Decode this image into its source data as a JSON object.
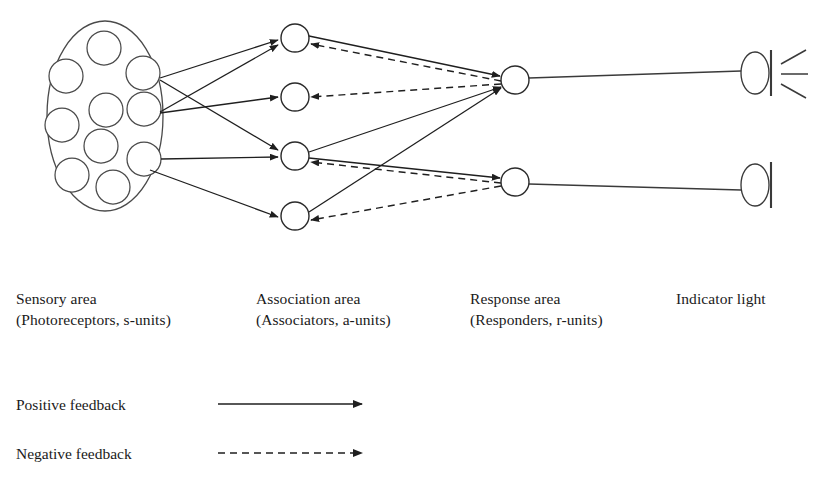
{
  "figure": {
    "background_color": "#ffffff",
    "line_color": "#1f1f1f"
  },
  "columns": [
    {
      "id": "sensory",
      "line1": "Sensory area",
      "line2": "(Photoreceptors, s-units)",
      "x": 16
    },
    {
      "id": "association",
      "line1": "Association area",
      "line2": "(Associators, a-units)",
      "x": 256
    },
    {
      "id": "response",
      "line1": "Response area",
      "line2": "(Responders, r-units)",
      "x": 470
    },
    {
      "id": "indicator",
      "line1": "Indicator light",
      "line2": "",
      "x": 676
    }
  ],
  "legend": {
    "items": [
      {
        "id": "positive",
        "label": "Positive feedback",
        "style": "solid"
      },
      {
        "id": "negative",
        "label": "Negative feedback",
        "style": "dashed"
      }
    ]
  },
  "sensory_area": {
    "ellipse": {
      "cx": 105,
      "cy": 116,
      "rx": 58,
      "ry": 95
    },
    "receptors": [
      {
        "id": "s1",
        "cx": 104,
        "cy": 48,
        "r": 17
      },
      {
        "id": "s2",
        "cx": 66,
        "cy": 76,
        "r": 17
      },
      {
        "id": "s3",
        "cx": 143,
        "cy": 73,
        "r": 17
      },
      {
        "id": "s4",
        "cx": 106,
        "cy": 110,
        "r": 17
      },
      {
        "id": "s5",
        "cx": 144,
        "cy": 109,
        "r": 17
      },
      {
        "id": "s6",
        "cx": 62,
        "cy": 125,
        "r": 17
      },
      {
        "id": "s7",
        "cx": 101,
        "cy": 146,
        "r": 17
      },
      {
        "id": "s8",
        "cx": 144,
        "cy": 159,
        "r": 17
      },
      {
        "id": "s9",
        "cx": 72,
        "cy": 175,
        "r": 17
      },
      {
        "id": "s10",
        "cx": 113,
        "cy": 187,
        "r": 17
      }
    ]
  },
  "association_units": [
    {
      "id": "a1",
      "cx": 295,
      "cy": 38,
      "r": 14
    },
    {
      "id": "a2",
      "cx": 295,
      "cy": 97,
      "r": 14
    },
    {
      "id": "a3",
      "cx": 295,
      "cy": 156,
      "r": 14
    },
    {
      "id": "a4",
      "cx": 295,
      "cy": 216,
      "r": 14
    }
  ],
  "response_units": [
    {
      "id": "r1",
      "cx": 515,
      "cy": 80,
      "r": 14
    },
    {
      "id": "r2",
      "cx": 515,
      "cy": 182,
      "r": 14
    }
  ],
  "indicator_lights": [
    {
      "id": "light1",
      "cx": 755,
      "cy": 73,
      "rx": 14,
      "ry": 21,
      "lit": true
    },
    {
      "id": "light2",
      "cx": 755,
      "cy": 185,
      "rx": 14,
      "ry": 21,
      "lit": false
    }
  ],
  "edges": {
    "sensory_to_association": [
      {
        "id": "s3-a1",
        "from": [
          160,
          78
        ],
        "to": [
          278,
          40
        ],
        "style": "solid"
      },
      {
        "id": "s3-a3",
        "from": [
          160,
          80
        ],
        "to": [
          278,
          150
        ],
        "style": "solid"
      },
      {
        "id": "s5-a1",
        "from": [
          160,
          112
        ],
        "to": [
          278,
          45
        ],
        "style": "solid"
      },
      {
        "id": "s5-a2",
        "from": [
          160,
          113
        ],
        "to": [
          278,
          97
        ],
        "style": "solid"
      },
      {
        "id": "s8-a3",
        "from": [
          161,
          159
        ],
        "to": [
          278,
          157
        ],
        "style": "solid"
      },
      {
        "id": "s8-a4",
        "from": [
          150,
          170
        ],
        "to": [
          278,
          217
        ],
        "style": "solid"
      }
    ],
    "association_to_response": [
      {
        "id": "a1-r1",
        "from": [
          309,
          36
        ],
        "to": [
          500,
          76
        ],
        "style": "solid"
      },
      {
        "id": "a3-r1",
        "from": [
          309,
          152
        ],
        "to": [
          501,
          87
        ],
        "style": "solid"
      },
      {
        "id": "a3-r2",
        "from": [
          309,
          158
        ],
        "to": [
          500,
          178
        ],
        "style": "solid"
      },
      {
        "id": "a4-r1",
        "from": [
          309,
          212
        ],
        "to": [
          501,
          88
        ],
        "style": "solid"
      }
    ],
    "response_to_association": [
      {
        "id": "r1-a1",
        "from": [
          501,
          81
        ],
        "to": [
          311,
          44
        ],
        "style": "dashed"
      },
      {
        "id": "r1-a2",
        "from": [
          501,
          84
        ],
        "to": [
          311,
          97
        ],
        "style": "dashed"
      },
      {
        "id": "r2-a3",
        "from": [
          501,
          183
        ],
        "to": [
          311,
          162
        ],
        "style": "dashed"
      },
      {
        "id": "r2-a4",
        "from": [
          501,
          186
        ],
        "to": [
          311,
          220
        ],
        "style": "dashed"
      }
    ],
    "response_to_light": [
      {
        "id": "r1-light1",
        "from": [
          529,
          78
        ],
        "to": [
          741,
          71
        ],
        "style": "plain"
      },
      {
        "id": "r2-light2",
        "from": [
          529,
          184
        ],
        "to": [
          741,
          190
        ],
        "style": "plain"
      }
    ]
  }
}
